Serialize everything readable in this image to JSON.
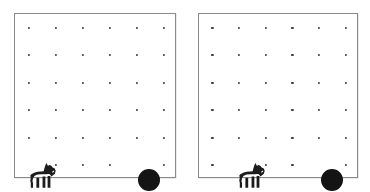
{
  "scene": {
    "title": "Two grid-world panels with dog agent and ball target",
    "width": 370,
    "height": 192,
    "background_color": "#ffffff",
    "panel_border_color": "#8a8a8a",
    "dot_color": "#3a3a3a",
    "ball_color": "#141414",
    "dog_color": "#1c1c1c"
  },
  "grid": {
    "columns": 6,
    "rows": 6,
    "dot_diameter_px": 2.2
  },
  "panels": [
    {
      "id": "panel-left",
      "label": "left-panel",
      "x": 14,
      "y": 13,
      "width": 162,
      "height": 165,
      "dots_hidden": [
        {
          "col": 1,
          "row": 6
        },
        {
          "col": 5,
          "row": 6
        }
      ],
      "dog": {
        "label": "dog-agent",
        "col": 1,
        "row": 6,
        "x": 27,
        "y": 176,
        "width": 28,
        "height": 28,
        "facing": "right"
      },
      "ball": {
        "label": "ball-target",
        "col": 5,
        "row": 6,
        "x": 134,
        "y": 166,
        "diameter": 22
      }
    },
    {
      "id": "panel-right",
      "label": "right-panel",
      "x": 198,
      "y": 13,
      "width": 160,
      "height": 165,
      "dots_hidden": [
        {
          "col": 2,
          "row": 6
        },
        {
          "col": 5,
          "row": 6
        }
      ],
      "dog": {
        "label": "dog-agent",
        "col": 2,
        "row": 6,
        "x": 52,
        "y": 176,
        "width": 28,
        "height": 28,
        "facing": "right"
      },
      "ball": {
        "label": "ball-target",
        "col": 5,
        "row": 6,
        "x": 133,
        "y": 166,
        "diameter": 22
      }
    }
  ]
}
